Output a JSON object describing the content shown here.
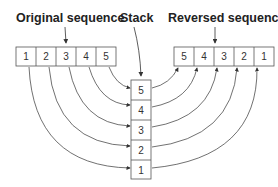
{
  "labels": {
    "original": "Original sequence",
    "stack": "Stack",
    "reversed": "Reversed sequence"
  },
  "original_sequence": [
    "1",
    "2",
    "3",
    "4",
    "5"
  ],
  "stack": [
    "5",
    "4",
    "3",
    "2",
    "1"
  ],
  "reversed_sequence": [
    "5",
    "4",
    "3",
    "2",
    "1"
  ],
  "colors": {
    "stroke": "#555555",
    "text": "#222222"
  }
}
